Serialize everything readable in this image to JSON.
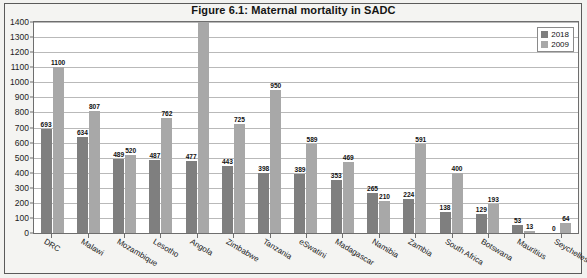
{
  "figure": {
    "title": "Figure 6.1: Maternal mortality in SADC"
  },
  "legend": {
    "position": "top-right",
    "entries": [
      {
        "label": "2018",
        "color": "#7f7f7f"
      },
      {
        "label": "2009",
        "color": "#a8a8a8"
      }
    ]
  },
  "chart_data": {
    "type": "bar",
    "title": "Figure 6.1: Maternal mortality in SADC",
    "xlabel": "",
    "ylabel": "",
    "ylim": [
      0,
      1400
    ],
    "ytick_step": 100,
    "yticks": [
      1400,
      1300,
      1200,
      1100,
      1000,
      900,
      800,
      700,
      600,
      500,
      400,
      300,
      200,
      100,
      0
    ],
    "grid": true,
    "legend_position": "top-right",
    "categories": [
      "DRC",
      "Malawi",
      "Mozambique",
      "Lesotho",
      "Angola",
      "Zimbabwe",
      "Tanzania",
      "eSwatini",
      "Madagascar",
      "Namibia",
      "Zambia",
      "South Africa",
      "Botswana",
      "Mauritius",
      "Seychelles"
    ],
    "series": [
      {
        "name": "2018",
        "color": "#7f7f7f",
        "values": [
          693,
          634,
          489,
          487,
          477,
          443,
          398,
          389,
          353,
          265,
          224,
          138,
          129,
          53,
          0
        ]
      },
      {
        "name": "2009",
        "color": "#a8a8a8",
        "values": [
          1100,
          807,
          520,
          762,
          1400,
          725,
          950,
          589,
          469,
          210,
          591,
          400,
          193,
          13,
          64
        ]
      }
    ]
  }
}
